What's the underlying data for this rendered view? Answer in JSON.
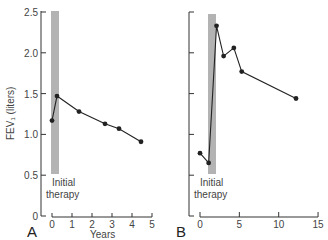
{
  "chart_data": [
    {
      "type": "line",
      "panel": "A",
      "title": "",
      "xlabel": "Years",
      "ylabel": "FEV₁ (liters)",
      "xlim": [
        0,
        5
      ],
      "ylim": [
        0,
        2.5
      ],
      "xticks": [
        "0",
        "1",
        "2",
        "3",
        "4",
        "5"
      ],
      "yticks": [
        "0",
        "0.5",
        "1.0",
        "1.5",
        "2.0",
        "2.5"
      ],
      "grid": false,
      "annotation": {
        "text_line1": "Initial",
        "text_line2": "therapy",
        "band_x": [
          0,
          0.35
        ],
        "band_y": [
          0.5,
          2.5
        ]
      },
      "x": [
        0,
        0.25,
        1.35,
        2.65,
        3.35,
        4.45
      ],
      "values": [
        1.17,
        1.47,
        1.28,
        1.13,
        1.07,
        0.91
      ]
    },
    {
      "type": "line",
      "panel": "B",
      "title": "",
      "xlabel": "",
      "ylabel": "",
      "xlim": [
        0,
        15
      ],
      "ylim": [
        0,
        2.5
      ],
      "xticks": [
        "0",
        "5",
        "10",
        "15"
      ],
      "yticks": [
        "",
        "",
        "",
        "",
        "",
        ""
      ],
      "grid": false,
      "annotation": {
        "text_line1": "Initial",
        "text_line2": "therapy",
        "band_x": [
          1.1,
          2.0
        ],
        "band_y": [
          0.5,
          2.5
        ]
      },
      "x": [
        0,
        1.1,
        2.1,
        3.0,
        4.3,
        5.3,
        12.2
      ],
      "values": [
        0.77,
        0.65,
        2.33,
        1.96,
        2.06,
        1.77,
        1.44
      ]
    }
  ],
  "labels": {
    "panel_a": "A",
    "panel_b": "B",
    "x_axis_title": "Years",
    "y_axis_title": "FEV₁ (liters)",
    "a_yticks": [
      "0",
      "0.5",
      "1.0",
      "1.5",
      "2.0",
      "2.5"
    ],
    "a_xticks": [
      "0",
      "1",
      "2",
      "3",
      "4",
      "5"
    ],
    "b_xticks": [
      "0",
      "5",
      "10",
      "15"
    ],
    "therapy_line1": "Initial",
    "therapy_line2": "therapy"
  },
  "colors": {
    "band": "#b3b3b3",
    "line": "#222222",
    "axis": "#333333"
  }
}
